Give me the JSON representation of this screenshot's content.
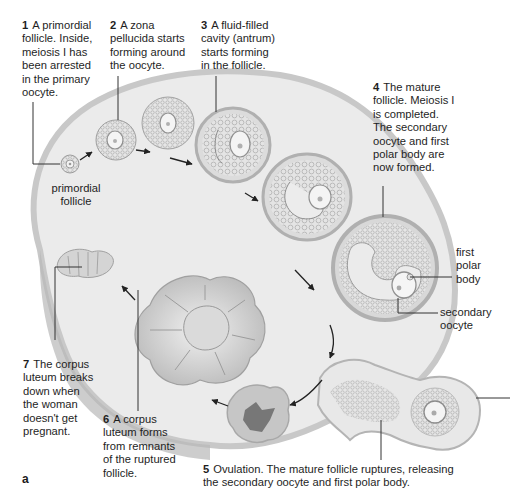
{
  "figure": {
    "panel_letter": "a",
    "steps": [
      {
        "num": "1",
        "text": "A primordial\nfollicle. Inside,\nmeiosis I has\nbeen arrested\nin the primary\noocyte."
      },
      {
        "num": "2",
        "text": "A zona\npellucida starts\nforming around\nthe oocyte."
      },
      {
        "num": "3",
        "text": "A fluid-filled\ncavity (antrum)\nstarts forming\nin the follicle."
      },
      {
        "num": "4",
        "text": "The mature\nfollicle. Meiosis I\nis completed.\nThe secondary\noocyte and first\npolar body are\nnow formed."
      },
      {
        "num": "5",
        "text": "Ovulation. The mature follicle ruptures, releasing\nthe secondary oocyte and first polar body."
      },
      {
        "num": "6",
        "text": "A corpus\nluteum forms\nfrom remnants\nof the ruptured\nfollicle."
      },
      {
        "num": "7",
        "text": "The corpus\nluteum breaks\ndown when\nthe woman\ndoesn't get\npregnant."
      }
    ],
    "labels": {
      "primordial_follicle": "primordial\nfollicle",
      "first_polar_body": "first\npolar\nbody",
      "secondary_oocyte": "secondary\noocyte"
    },
    "colors": {
      "ovary_fill": "#ececec",
      "ovary_edge": "#c4c4c4",
      "follicle_fill": "#e2e2e2",
      "follicle_ring": "#b4b4b4",
      "dark_core": "#7a7a7a",
      "text": "#1e1e1e"
    }
  }
}
